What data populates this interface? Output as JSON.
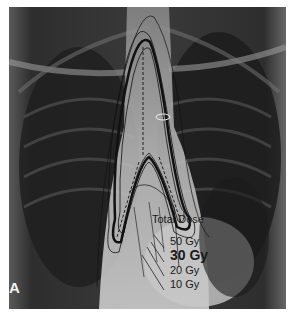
{
  "figure": {
    "panel_label": "A",
    "legend": {
      "title": "Total Dose",
      "items": [
        {
          "label": "50 Gy",
          "bold": false
        },
        {
          "label": "30 Gy",
          "bold": true
        },
        {
          "label": "20 Gy",
          "bold": false
        },
        {
          "label": "10 Gy",
          "bold": false
        }
      ]
    }
  }
}
